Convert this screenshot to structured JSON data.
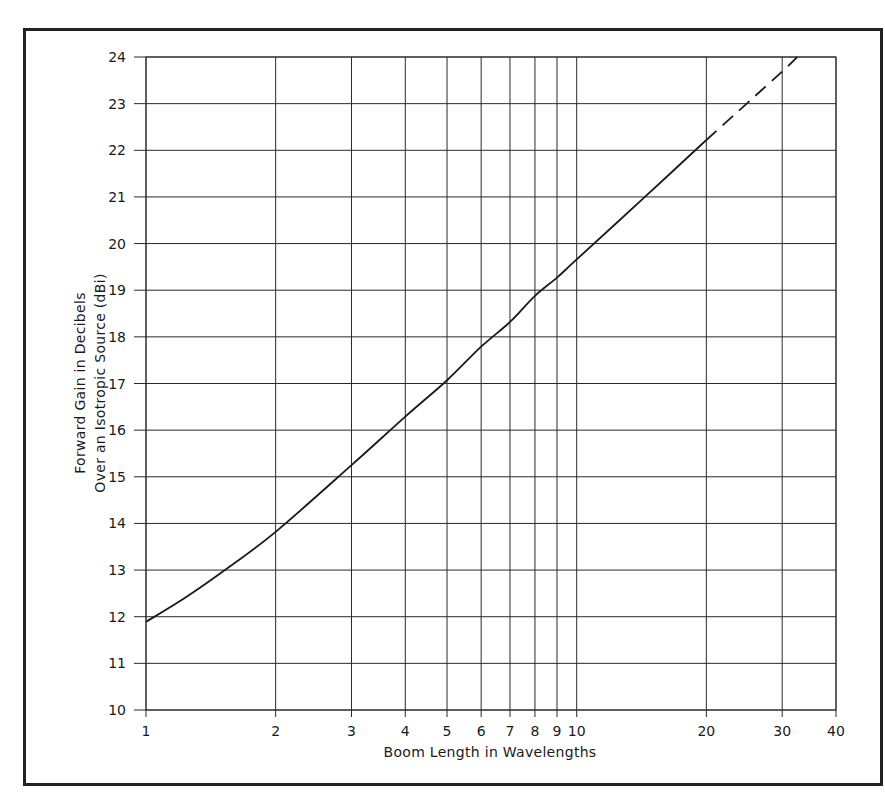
{
  "chart_data": {
    "type": "line",
    "title": "",
    "xlabel": "Boom Length in Wavelengths",
    "ylabel_lines": [
      "Forward Gain in Decibels",
      "Over an Isotropic Source (dBi)"
    ],
    "ylabel": "Forward Gain in Decibels Over an Isotropic Source (dBi)",
    "x_scale": "log",
    "xlim": [
      1,
      40
    ],
    "ylim": [
      10,
      24
    ],
    "grid": true,
    "legend": "none",
    "x_ticks": [
      1,
      2,
      3,
      4,
      5,
      6,
      7,
      8,
      9,
      10,
      20,
      30,
      40
    ],
    "x_tick_labels": [
      "1",
      "2",
      "3",
      "4",
      "5",
      "6",
      "7",
      "8",
      "9",
      "10",
      "20",
      "30",
      "40"
    ],
    "y_ticks": [
      10,
      11,
      12,
      13,
      14,
      15,
      16,
      17,
      18,
      19,
      20,
      21,
      22,
      23,
      24
    ],
    "y_tick_labels": [
      "10",
      "11",
      "12",
      "13",
      "14",
      "15",
      "16",
      "17",
      "18",
      "19",
      "20",
      "21",
      "22",
      "23",
      "24"
    ],
    "series": [
      {
        "name": "Forward gain (measured)",
        "style": "solid",
        "x": [
          1,
          1.23,
          1.525,
          2,
          3,
          4,
          5,
          6,
          7,
          8,
          9,
          10,
          14.4,
          20
        ],
        "y": [
          11.89,
          12.4,
          13.0,
          13.82,
          15.25,
          16.29,
          17.07,
          17.79,
          18.32,
          18.88,
          19.27,
          19.66,
          21.0,
          22.22
        ]
      },
      {
        "name": "Forward gain (extrapolated)",
        "style": "dashed",
        "x": [
          20,
          30,
          32.5
        ],
        "y": [
          22.22,
          23.69,
          24.0
        ]
      }
    ]
  },
  "colors": {
    "line": "#1a1a1a",
    "grid": "#2a2a2a",
    "frame": "#222222",
    "background": "#ffffff"
  }
}
